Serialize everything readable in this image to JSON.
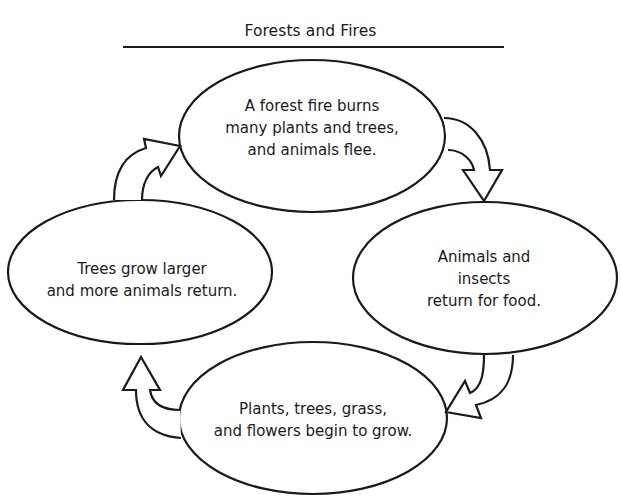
{
  "title": "Forests and Fires",
  "cycle": {
    "nodes": [
      {
        "id": "fire",
        "text": "A forest fire burns\nmany plants and trees,\nand animals flee."
      },
      {
        "id": "animals-return",
        "text": "Animals and insects\nreturn for food."
      },
      {
        "id": "plants-grow",
        "text": "Plants, trees, grass,\nand flowers begin to grow."
      },
      {
        "id": "trees-grow",
        "text": "Trees grow larger\nand more animals return."
      }
    ],
    "arrows": [
      {
        "from": "fire",
        "to": "animals-return",
        "direction": "clockwise"
      },
      {
        "from": "animals-return",
        "to": "plants-grow",
        "direction": "clockwise"
      },
      {
        "from": "plants-grow",
        "to": "trees-grow",
        "direction": "clockwise"
      },
      {
        "from": "trees-grow",
        "to": "fire",
        "direction": "clockwise"
      }
    ]
  },
  "colors": {
    "stroke": "#1a1a1a",
    "background": "#ffffff"
  }
}
